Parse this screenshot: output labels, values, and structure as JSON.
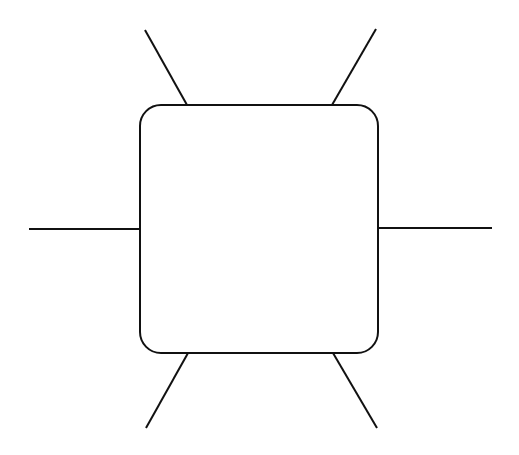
{
  "diagram": {
    "background": "#ffffff",
    "stroke_color": "#111111",
    "stroke_width": 2,
    "node": {
      "shape": "rounded-square",
      "x": 140,
      "y": 105,
      "width": 238,
      "height": 248,
      "corner_radius": 21,
      "fill": "#ffffff",
      "label": ""
    },
    "connectors": [
      {
        "name": "top-left",
        "x1": 145,
        "y1": 30,
        "x2": 187,
        "y2": 105
      },
      {
        "name": "top-right",
        "x1": 376,
        "y1": 29,
        "x2": 332,
        "y2": 105
      },
      {
        "name": "left",
        "x1": 29,
        "y1": 229,
        "x2": 140,
        "y2": 229
      },
      {
        "name": "right",
        "x1": 378,
        "y1": 228,
        "x2": 492,
        "y2": 228
      },
      {
        "name": "bottom-left",
        "x1": 188,
        "y1": 353,
        "x2": 146,
        "y2": 428
      },
      {
        "name": "bottom-right",
        "x1": 333,
        "y1": 353,
        "x2": 377,
        "y2": 428
      }
    ]
  }
}
